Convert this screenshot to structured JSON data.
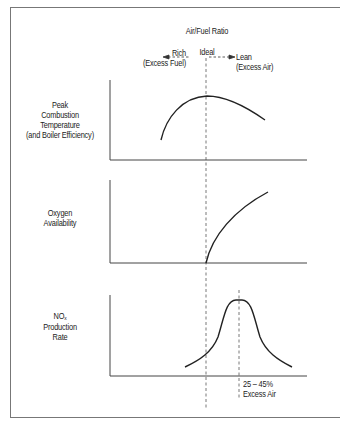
{
  "header": {
    "title": "Air/Fuel Ratio",
    "left_label_line1": "Rich",
    "left_label_line2": "(Excess Fuel)",
    "center_label": "Ideal",
    "right_label_line1": "Lean",
    "right_label_line2": "(Excess Air)"
  },
  "panels": [
    {
      "label_lines": [
        "Peak",
        "Combustion",
        "Temperature",
        "(and Boiler Efficiency)"
      ]
    },
    {
      "label_lines": [
        "Oxygen",
        "Availability"
      ]
    },
    {
      "label_lines": [
        "NOx",
        "Production",
        "Rate"
      ],
      "label_main": "NO",
      "label_sub": "x"
    }
  ],
  "annotation": {
    "line1": "25 – 45%",
    "line2": "Excess Air"
  },
  "colors": {
    "line": "#222222",
    "axis": "#444444",
    "frame": "#777777"
  }
}
